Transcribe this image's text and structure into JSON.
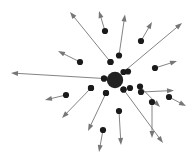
{
  "figure": {
    "type": "radial-vector-field",
    "width": 196,
    "height": 167,
    "background_color": "#ffffff",
    "arrow_color": "#767676",
    "node_color": "#1a1a1a",
    "hub_color": "#222222",
    "arrow_stroke_width": 0.9,
    "node_radius": 3.1,
    "hub": {
      "label": "central-hub",
      "cx": 115,
      "cy": 80,
      "r": 8.2
    },
    "vectors": [
      {
        "id": "v01",
        "label": "up-left-long",
        "node_x": 110.5,
        "node_y": 62.0,
        "tip_x": 70.0,
        "tip_y": 12.0
      },
      {
        "id": "v02",
        "label": "up-short-center",
        "node_x": 105.0,
        "node_y": 31.0,
        "tip_x": 99.0,
        "tip_y": 11.0
      },
      {
        "id": "v03",
        "label": "up-mid-right",
        "node_x": 119.0,
        "node_y": 55.5,
        "tip_x": 125.0,
        "tip_y": 14.5
      },
      {
        "id": "v04",
        "label": "up-right-diagonal",
        "node_x": 123.5,
        "node_y": 72.0,
        "tip_x": 182.0,
        "tip_y": 23.0
      },
      {
        "id": "v05",
        "label": "up-right-short",
        "node_x": 141.0,
        "node_y": 41.0,
        "tip_x": 152.0,
        "tip_y": 22.0
      },
      {
        "id": "v06",
        "label": "left-long-horizontal",
        "node_x": 104.0,
        "node_y": 78.5,
        "tip_x": 11.0,
        "tip_y": 73.0
      },
      {
        "id": "v07",
        "label": "up-left-short",
        "node_x": 80.0,
        "node_y": 62.0,
        "tip_x": 58.0,
        "tip_y": 51.0
      },
      {
        "id": "v08",
        "label": "right-horizontal",
        "node_x": 141.0,
        "node_y": 92.0,
        "tip_x": 174.0,
        "tip_y": 90.5
      },
      {
        "id": "v09",
        "label": "right-upper-short",
        "node_x": 155.0,
        "node_y": 68.0,
        "tip_x": 177.0,
        "tip_y": 61.0
      },
      {
        "id": "v10",
        "label": "left-lower-short",
        "node_x": 66.0,
        "node_y": 95.0,
        "tip_x": 45.0,
        "tip_y": 100.0
      },
      {
        "id": "v11",
        "label": "down-left-diagonal",
        "node_x": 91.0,
        "node_y": 88.0,
        "tip_x": 62.0,
        "tip_y": 118.0
      },
      {
        "id": "v12",
        "label": "down-left-long",
        "node_x": 106.0,
        "node_y": 93.0,
        "tip_x": 88.0,
        "tip_y": 131.0
      },
      {
        "id": "v13",
        "label": "down-center-short",
        "node_x": 103.0,
        "node_y": 130.0,
        "tip_x": 99.0,
        "tip_y": 152.0
      },
      {
        "id": "v14",
        "label": "down-vertical",
        "node_x": 119.0,
        "node_y": 111.0,
        "tip_x": 121.0,
        "tip_y": 145.0
      },
      {
        "id": "v15",
        "label": "down-right-long",
        "node_x": 123.5,
        "node_y": 89.5,
        "tip_x": 163.0,
        "tip_y": 143.0
      },
      {
        "id": "v16",
        "label": "down-right-diagonal",
        "node_x": 140.0,
        "node_y": 86.5,
        "tip_x": 160.0,
        "tip_y": 107.0
      },
      {
        "id": "v17",
        "label": "down-right-far",
        "node_x": 169.0,
        "node_y": 97.0,
        "tip_x": 186.0,
        "tip_y": 106.0
      },
      {
        "id": "v18",
        "label": "down-far-left",
        "node_x": 152.0,
        "node_y": 102.0,
        "tip_x": 152.0,
        "tip_y": 138.0
      }
    ],
    "hub_satellites": [
      {
        "label": "satellite-nw",
        "cx": 104.0,
        "cy": 78.5
      },
      {
        "label": "satellite-n",
        "cx": 110.5,
        "cy": 62.0
      },
      {
        "label": "satellite-ne",
        "cx": 128.0,
        "cy": 71.5
      },
      {
        "label": "satellite-e",
        "cx": 130.0,
        "cy": 88.0
      },
      {
        "label": "satellite-se",
        "cx": 123.5,
        "cy": 89.5
      },
      {
        "label": "satellite-s",
        "cx": 106.0,
        "cy": 93.0
      },
      {
        "label": "satellite-sw",
        "cx": 91.0,
        "cy": 88.0
      }
    ]
  }
}
